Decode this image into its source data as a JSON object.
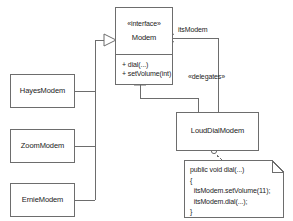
{
  "diagram": {
    "background": "#ffffff",
    "line_color": "#6d6d6d",
    "text_color": "#1b1b1b"
  },
  "interface_node": {
    "stereotype": "«interface»",
    "name": "Modem",
    "operations": [
      "+ dial(...)",
      "+ setVolume(int)"
    ]
  },
  "classes": [
    {
      "name": "HayesModem"
    },
    {
      "name": "ZoomModem"
    },
    {
      "name": "ErnieModem"
    },
    {
      "name": "LoudDialModem"
    }
  ],
  "edge_labels": {
    "association": "itsModem",
    "delegates": "«delegates»"
  },
  "note": {
    "lines": [
      "public void dial(...)",
      "{",
      "  itsModem.setVolume(11);",
      "  itsModem.dial(...);",
      "}"
    ],
    "text": "public void dial(...)\n{\n  itsModem.setVolume(11);\n  itsModem.dial(...);\n}"
  }
}
